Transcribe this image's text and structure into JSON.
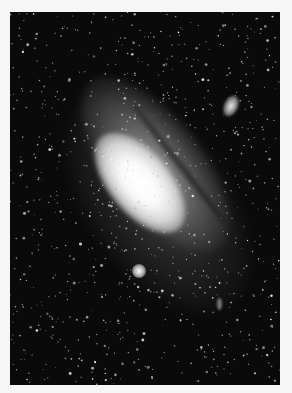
{
  "image": {
    "subject": "Andromeda Galaxy",
    "style": "grayscale astronomical photograph",
    "colors": {
      "border": "#f6f6f6",
      "sky": "#0a0a0a",
      "core": "#ffffff",
      "stars": "#e8e8e8"
    },
    "objects": [
      {
        "name": "galaxy-core",
        "position": [
          139,
          180
        ]
      },
      {
        "name": "satellite-galaxy-upper-right",
        "position": [
          230,
          105
        ]
      },
      {
        "name": "satellite-galaxy-lower",
        "position": [
          139,
          271
        ]
      }
    ]
  }
}
